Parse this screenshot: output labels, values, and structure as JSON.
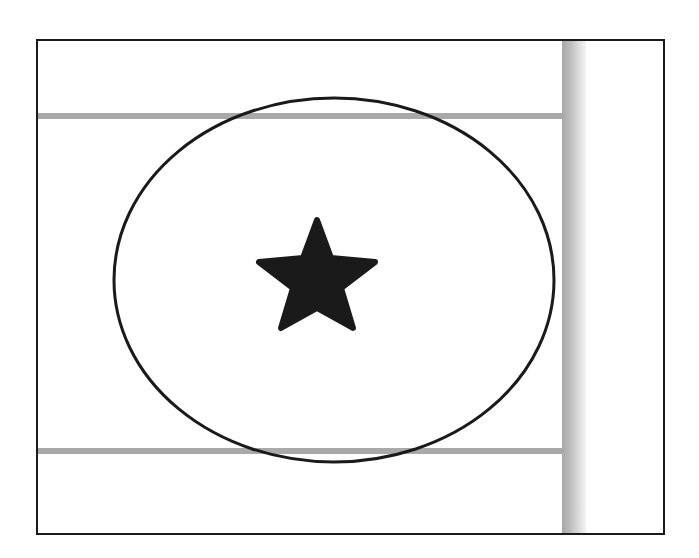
{
  "diagram": {
    "colors": {
      "frame": "#1a1a1a",
      "lines": "#a9a9a9",
      "ellipse_stroke": "#1a1a1a",
      "star_fill": "#1a1a1a",
      "band": "#bdbdbd"
    },
    "elements": [
      {
        "type": "frame",
        "shape": "rectangle"
      },
      {
        "type": "horizontal-line",
        "position": "top"
      },
      {
        "type": "horizontal-line",
        "position": "bottom"
      },
      {
        "type": "vertical-band",
        "position": "right"
      },
      {
        "type": "ellipse",
        "shape": "ellipse"
      },
      {
        "type": "icon",
        "shape": "star-icon",
        "fill": "solid"
      }
    ]
  }
}
